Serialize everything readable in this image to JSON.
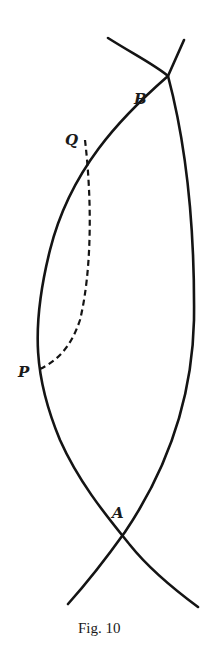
{
  "figure": {
    "caption": "Fig. 10",
    "points": [
      {
        "id": "B",
        "label": "B"
      },
      {
        "id": "Q",
        "label": "Q"
      },
      {
        "id": "P",
        "label": "P"
      },
      {
        "id": "A",
        "label": "A"
      }
    ],
    "curves": [
      {
        "id": "left-arc",
        "style": "solid",
        "description": "arc from lower right through A, P, Q, B to upper right"
      },
      {
        "id": "right-arc",
        "style": "solid",
        "description": "arc from upper left through B, A to lower left"
      },
      {
        "id": "geodesic-PQ",
        "style": "dashed",
        "description": "dashed curve joining P and Q"
      }
    ],
    "colors": {
      "ink": "#141414",
      "background": "#ffffff"
    }
  }
}
